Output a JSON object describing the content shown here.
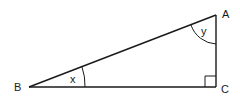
{
  "diagram": {
    "type": "right-triangle",
    "vertices": {
      "A": {
        "label": "A",
        "x": 216,
        "y": 15
      },
      "B": {
        "label": "B",
        "x": 29,
        "y": 87
      },
      "C": {
        "label": "C",
        "x": 216,
        "y": 87
      }
    },
    "angles": {
      "at_B": {
        "label": "x"
      },
      "at_A": {
        "label": "y"
      },
      "at_C": {
        "label": "",
        "right_angle": true
      }
    },
    "colors": {
      "stroke": "#1a1a1a",
      "background": "#ffffff"
    }
  }
}
